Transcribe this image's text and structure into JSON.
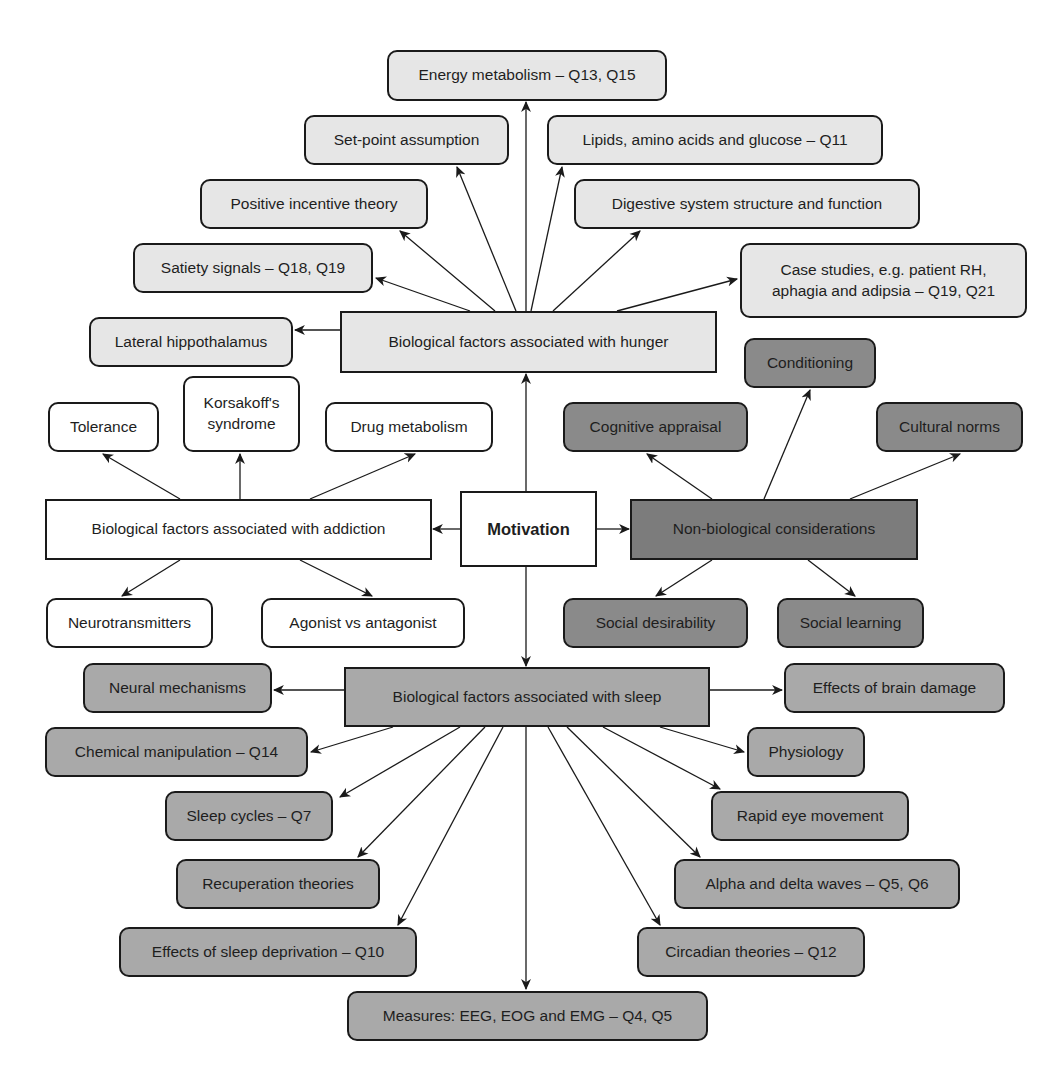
{
  "colors": {
    "light": "#e6e6e6",
    "white": "#ffffff",
    "mid": "#a9a9a9",
    "dark": "#8a8a8a",
    "darker": "#7c7c7c",
    "stroke": "#1a1a1a"
  },
  "nodes": [
    {
      "id": "motivation",
      "label": "Motivation",
      "x": 460,
      "y": 491,
      "w": 137,
      "h": 76,
      "shape": "square",
      "color": "white",
      "bold": true
    },
    {
      "id": "hunger",
      "label": "Biological factors associated with hunger",
      "x": 340,
      "y": 311,
      "w": 377,
      "h": 62,
      "shape": "square",
      "color": "light"
    },
    {
      "id": "energy",
      "label": "Energy metabolism – Q13, Q15",
      "x": 387,
      "y": 50,
      "w": 280,
      "h": 51,
      "shape": "rounded",
      "color": "light"
    },
    {
      "id": "setpoint",
      "label": "Set-point assumption",
      "x": 304,
      "y": 115,
      "w": 205,
      "h": 50,
      "shape": "rounded",
      "color": "light"
    },
    {
      "id": "lipids",
      "label": "Lipids, amino acids and glucose – Q11",
      "x": 547,
      "y": 115,
      "w": 336,
      "h": 50,
      "shape": "rounded",
      "color": "light"
    },
    {
      "id": "positive",
      "label": "Positive incentive theory",
      "x": 200,
      "y": 179,
      "w": 228,
      "h": 50,
      "shape": "rounded",
      "color": "light"
    },
    {
      "id": "digestive",
      "label": "Digestive system structure and function",
      "x": 574,
      "y": 179,
      "w": 346,
      "h": 50,
      "shape": "rounded",
      "color": "light"
    },
    {
      "id": "satiety",
      "label": "Satiety signals – Q18, Q19",
      "x": 133,
      "y": 243,
      "w": 240,
      "h": 50,
      "shape": "rounded",
      "color": "light"
    },
    {
      "id": "casestudies",
      "label": "Case studies, e.g. patient RH,\naphagia and adipsia – Q19, Q21",
      "x": 740,
      "y": 243,
      "w": 287,
      "h": 75,
      "shape": "rounded",
      "color": "light"
    },
    {
      "id": "lateral",
      "label": "Lateral hippothalamus",
      "x": 89,
      "y": 317,
      "w": 204,
      "h": 50,
      "shape": "rounded",
      "color": "light"
    },
    {
      "id": "addiction",
      "label": "Biological factors associated with addiction",
      "x": 45,
      "y": 499,
      "w": 387,
      "h": 61,
      "shape": "square",
      "color": "white"
    },
    {
      "id": "tolerance",
      "label": "Tolerance",
      "x": 48,
      "y": 402,
      "w": 111,
      "h": 50,
      "shape": "rounded",
      "color": "white"
    },
    {
      "id": "korsakoff",
      "label": "Korsakoff's\nsyndrome",
      "x": 183,
      "y": 376,
      "w": 117,
      "h": 76,
      "shape": "rounded",
      "color": "white"
    },
    {
      "id": "drugmetabolism",
      "label": "Drug metabolism",
      "x": 325,
      "y": 402,
      "w": 168,
      "h": 50,
      "shape": "rounded",
      "color": "white"
    },
    {
      "id": "neurotransmitters",
      "label": "Neurotransmitters",
      "x": 46,
      "y": 598,
      "w": 167,
      "h": 50,
      "shape": "rounded",
      "color": "white"
    },
    {
      "id": "agonist",
      "label": "Agonist vs antagonist",
      "x": 261,
      "y": 598,
      "w": 204,
      "h": 50,
      "shape": "rounded",
      "color": "white"
    },
    {
      "id": "nonbio",
      "label": "Non-biological considerations",
      "x": 630,
      "y": 499,
      "w": 288,
      "h": 61,
      "shape": "square",
      "color": "darker"
    },
    {
      "id": "conditioning",
      "label": "Conditioning",
      "x": 744,
      "y": 338,
      "w": 132,
      "h": 50,
      "shape": "rounded",
      "color": "dark"
    },
    {
      "id": "cognitive",
      "label": "Cognitive appraisal",
      "x": 563,
      "y": 402,
      "w": 185,
      "h": 50,
      "shape": "rounded",
      "color": "dark"
    },
    {
      "id": "cultural",
      "label": "Cultural norms",
      "x": 876,
      "y": 402,
      "w": 147,
      "h": 50,
      "shape": "rounded",
      "color": "dark"
    },
    {
      "id": "socialdesirability",
      "label": "Social desirability",
      "x": 563,
      "y": 598,
      "w": 185,
      "h": 50,
      "shape": "rounded",
      "color": "dark"
    },
    {
      "id": "sociallearning",
      "label": "Social learning",
      "x": 777,
      "y": 598,
      "w": 147,
      "h": 50,
      "shape": "rounded",
      "color": "dark"
    },
    {
      "id": "sleep",
      "label": "Biological factors associated with sleep",
      "x": 344,
      "y": 667,
      "w": 366,
      "h": 60,
      "shape": "square",
      "color": "mid"
    },
    {
      "id": "neural",
      "label": "Neural mechanisms",
      "x": 83,
      "y": 663,
      "w": 189,
      "h": 50,
      "shape": "rounded",
      "color": "mid"
    },
    {
      "id": "brainDamage",
      "label": "Effects of brain damage",
      "x": 784,
      "y": 663,
      "w": 221,
      "h": 50,
      "shape": "rounded",
      "color": "mid"
    },
    {
      "id": "chemical",
      "label": "Chemical manipulation – Q14",
      "x": 45,
      "y": 727,
      "w": 263,
      "h": 50,
      "shape": "rounded",
      "color": "mid"
    },
    {
      "id": "physiology",
      "label": "Physiology",
      "x": 747,
      "y": 727,
      "w": 118,
      "h": 50,
      "shape": "rounded",
      "color": "mid"
    },
    {
      "id": "sleepcycles",
      "label": "Sleep cycles – Q7",
      "x": 165,
      "y": 791,
      "w": 168,
      "h": 50,
      "shape": "rounded",
      "color": "mid"
    },
    {
      "id": "rem",
      "label": "Rapid eye movement",
      "x": 711,
      "y": 791,
      "w": 198,
      "h": 50,
      "shape": "rounded",
      "color": "mid"
    },
    {
      "id": "recuperation",
      "label": "Recuperation theories",
      "x": 176,
      "y": 859,
      "w": 204,
      "h": 50,
      "shape": "rounded",
      "color": "mid"
    },
    {
      "id": "alpha",
      "label": "Alpha and delta waves – Q5, Q6",
      "x": 674,
      "y": 859,
      "w": 286,
      "h": 50,
      "shape": "rounded",
      "color": "mid"
    },
    {
      "id": "deprivation",
      "label": "Effects of sleep deprivation – Q10",
      "x": 119,
      "y": 927,
      "w": 298,
      "h": 50,
      "shape": "rounded",
      "color": "mid"
    },
    {
      "id": "circadian",
      "label": "Circadian theories – Q12",
      "x": 637,
      "y": 927,
      "w": 228,
      "h": 50,
      "shape": "rounded",
      "color": "mid"
    },
    {
      "id": "measures",
      "label": "Measures: EEG, EOG and EMG – Q4, Q5",
      "x": 347,
      "y": 991,
      "w": 361,
      "h": 50,
      "shape": "rounded",
      "color": "mid"
    }
  ],
  "edges": [
    {
      "from": "motivation",
      "to": "hunger",
      "x1": 526,
      "y1": 491,
      "x2": 526,
      "y2": 374
    },
    {
      "from": "motivation",
      "to": "sleep",
      "x1": 526,
      "y1": 567,
      "x2": 526,
      "y2": 666
    },
    {
      "from": "motivation",
      "to": "addiction",
      "x1": 460,
      "y1": 529,
      "x2": 433,
      "y2": 529
    },
    {
      "from": "motivation",
      "to": "nonbio",
      "x1": 597,
      "y1": 529,
      "x2": 629,
      "y2": 529
    },
    {
      "from": "hunger",
      "to": "energy",
      "x1": 526,
      "y1": 311,
      "x2": 526,
      "y2": 102
    },
    {
      "from": "hunger",
      "to": "setpoint",
      "x1": 516,
      "y1": 311,
      "x2": 457,
      "y2": 167
    },
    {
      "from": "hunger",
      "to": "lipids",
      "x1": 531,
      "y1": 311,
      "x2": 562,
      "y2": 167
    },
    {
      "from": "hunger",
      "to": "positive",
      "x1": 495,
      "y1": 311,
      "x2": 400,
      "y2": 231
    },
    {
      "from": "hunger",
      "to": "digestive",
      "x1": 553,
      "y1": 311,
      "x2": 640,
      "y2": 231
    },
    {
      "from": "hunger",
      "to": "satiety",
      "x1": 470,
      "y1": 311,
      "x2": 376,
      "y2": 278
    },
    {
      "from": "hunger",
      "to": "casestudies",
      "x1": 617,
      "y1": 311,
      "x2": 737,
      "y2": 279
    },
    {
      "from": "hunger",
      "to": "lateral",
      "x1": 340,
      "y1": 330,
      "x2": 295,
      "y2": 330
    },
    {
      "from": "addiction",
      "to": "tolerance",
      "x1": 180,
      "y1": 499,
      "x2": 103,
      "y2": 454
    },
    {
      "from": "addiction",
      "to": "korsakoff",
      "x1": 240,
      "y1": 499,
      "x2": 240,
      "y2": 454
    },
    {
      "from": "addiction",
      "to": "drugmetabolism",
      "x1": 310,
      "y1": 499,
      "x2": 415,
      "y2": 454
    },
    {
      "from": "addiction",
      "to": "neurotransmitters",
      "x1": 180,
      "y1": 560,
      "x2": 122,
      "y2": 596
    },
    {
      "from": "addiction",
      "to": "agonist",
      "x1": 300,
      "y1": 560,
      "x2": 372,
      "y2": 596
    },
    {
      "from": "nonbio",
      "to": "cognitive",
      "x1": 712,
      "y1": 499,
      "x2": 647,
      "y2": 454
    },
    {
      "from": "nonbio",
      "to": "conditioning",
      "x1": 764,
      "y1": 499,
      "x2": 810,
      "y2": 390
    },
    {
      "from": "nonbio",
      "to": "cultural",
      "x1": 850,
      "y1": 499,
      "x2": 960,
      "y2": 454
    },
    {
      "from": "nonbio",
      "to": "socialdesirability",
      "x1": 712,
      "y1": 560,
      "x2": 656,
      "y2": 596
    },
    {
      "from": "nonbio",
      "to": "sociallearning",
      "x1": 808,
      "y1": 560,
      "x2": 855,
      "y2": 596
    },
    {
      "from": "sleep",
      "to": "neural",
      "x1": 344,
      "y1": 690,
      "x2": 274,
      "y2": 690
    },
    {
      "from": "sleep",
      "to": "brainDamage",
      "x1": 710,
      "y1": 690,
      "x2": 782,
      "y2": 690
    },
    {
      "from": "sleep",
      "to": "chemical",
      "x1": 393,
      "y1": 727,
      "x2": 311,
      "y2": 752
    },
    {
      "from": "sleep",
      "to": "physiology",
      "x1": 660,
      "y1": 727,
      "x2": 744,
      "y2": 752
    },
    {
      "from": "sleep",
      "to": "sleepcycles",
      "x1": 460,
      "y1": 727,
      "x2": 340,
      "y2": 797
    },
    {
      "from": "sleep",
      "to": "rem",
      "x1": 603,
      "y1": 727,
      "x2": 720,
      "y2": 789
    },
    {
      "from": "sleep",
      "to": "recuperation",
      "x1": 485,
      "y1": 727,
      "x2": 358,
      "y2": 857
    },
    {
      "from": "sleep",
      "to": "alpha",
      "x1": 567,
      "y1": 727,
      "x2": 700,
      "y2": 857
    },
    {
      "from": "sleep",
      "to": "deprivation",
      "x1": 503,
      "y1": 727,
      "x2": 398,
      "y2": 925
    },
    {
      "from": "sleep",
      "to": "circadian",
      "x1": 548,
      "y1": 727,
      "x2": 660,
      "y2": 925
    },
    {
      "from": "sleep",
      "to": "measures",
      "x1": 526,
      "y1": 727,
      "x2": 526,
      "y2": 989
    }
  ]
}
